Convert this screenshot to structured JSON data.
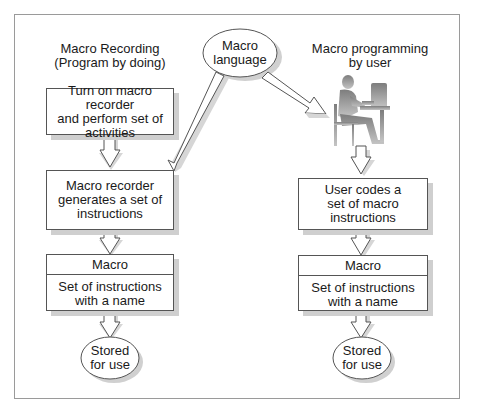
{
  "diagram": {
    "left_column": {
      "title": "Macro Recording\n(Program by doing)",
      "step1": "Turn on macro recorder\nand perform set of\nactivities",
      "step2": "Macro recorder\ngenerates a set of\ninstructions",
      "macro_header": "Macro",
      "macro_body": "Set of instructions\nwith a name",
      "storage": "Stored\nfor use"
    },
    "center": {
      "bubble": "Macro\nlanguage"
    },
    "right_column": {
      "title": "Macro programming\nby user",
      "figure": "person-at-computer-icon",
      "step1": "User codes a\nset of macro\ninstructions",
      "macro_header": "Macro",
      "macro_body": "Set of instructions\nwith a name",
      "storage": "Stored\nfor use"
    },
    "colors": {
      "border": "#555555",
      "shadow": "#cfcfcf",
      "frame": "#9a9a9a",
      "figure": "#9a9a9a"
    }
  }
}
